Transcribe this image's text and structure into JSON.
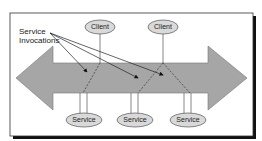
{
  "diagram": {
    "annotation": {
      "line1": "Service",
      "line2": "Invocations"
    },
    "clients": [
      {
        "label": "Client"
      },
      {
        "label": "Client"
      }
    ],
    "services": [
      {
        "label": "Service"
      },
      {
        "label": "Service"
      },
      {
        "label": "Service"
      }
    ],
    "colors": {
      "arrow_fill": "#a6a6a6",
      "node_fill": "#d9d9d9",
      "frame": "#000000",
      "shadow": "#111111"
    }
  }
}
